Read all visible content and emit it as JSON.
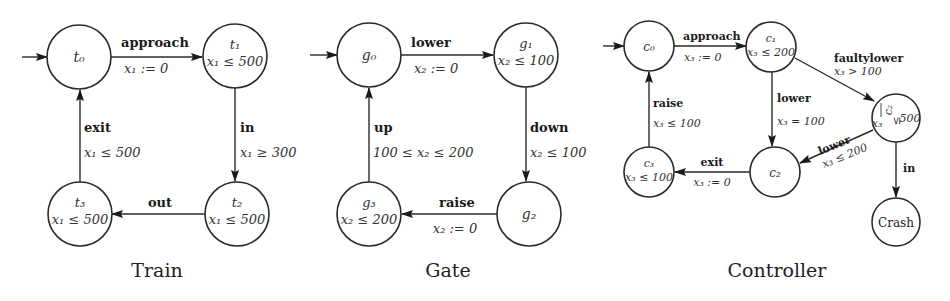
{
  "automata": [
    {
      "name": "Train",
      "caption": "Train",
      "states": [
        {
          "id": "t0",
          "name": "t0",
          "invariant": "",
          "initial": true
        },
        {
          "id": "t1",
          "name": "t1",
          "invariant": "x1 ≤ 500"
        },
        {
          "id": "t2",
          "name": "t2",
          "invariant": "x1 ≤ 500"
        },
        {
          "id": "t3",
          "name": "t3",
          "invariant": "x1 ≤ 500"
        }
      ],
      "transitions": [
        {
          "from": "t0",
          "to": "t1",
          "action": "approach",
          "guard_or_reset": "x1 := 0"
        },
        {
          "from": "t1",
          "to": "t2",
          "action": "in",
          "guard_or_reset": "x1 ≥ 300"
        },
        {
          "from": "t2",
          "to": "t3",
          "action": "out",
          "guard_or_reset": ""
        },
        {
          "from": "t3",
          "to": "t0",
          "action": "exit",
          "guard_or_reset": "x1 ≤ 500"
        }
      ]
    },
    {
      "name": "Gate",
      "caption": "Gate",
      "states": [
        {
          "id": "g0",
          "name": "g0",
          "invariant": "",
          "initial": true
        },
        {
          "id": "g1",
          "name": "g1",
          "invariant": "x2 ≤ 100"
        },
        {
          "id": "g2",
          "name": "g2",
          "invariant": ""
        },
        {
          "id": "g3",
          "name": "g3",
          "invariant": "x2 ≤ 200"
        }
      ],
      "transitions": [
        {
          "from": "g0",
          "to": "g1",
          "action": "lower",
          "guard_or_reset": "x2 := 0"
        },
        {
          "from": "g1",
          "to": "g2",
          "action": "down",
          "guard_or_reset": "x2 ≤ 100"
        },
        {
          "from": "g2",
          "to": "g3",
          "action": "raise",
          "guard_or_reset": "x2 := 0"
        },
        {
          "from": "g3",
          "to": "g0",
          "action": "up",
          "guard_or_reset": "100 ≤ x2 ≤ 200"
        }
      ]
    },
    {
      "name": "Controller",
      "caption": "Controller",
      "states": [
        {
          "id": "c0",
          "name": "c0",
          "invariant": "",
          "initial": true
        },
        {
          "id": "c1",
          "name": "c1",
          "invariant": "x3 ≤ 200"
        },
        {
          "id": "c2",
          "name": "c2",
          "invariant": ""
        },
        {
          "id": "c2bar",
          "name": "c̅2",
          "invariant": "x3 ≤ 500"
        },
        {
          "id": "c3",
          "name": "c3",
          "invariant": "x3 ≤ 100"
        },
        {
          "id": "crash",
          "name": "Crash",
          "invariant": ""
        }
      ],
      "transitions": [
        {
          "from": "c0",
          "to": "c1",
          "action": "approach",
          "guard_or_reset": "x3 := 0"
        },
        {
          "from": "c1",
          "to": "c2",
          "action": "lower",
          "guard_or_reset": "x3 = 100"
        },
        {
          "from": "c1",
          "to": "c2bar",
          "action": "faultylower",
          "guard_or_reset": "x3 > 100"
        },
        {
          "from": "c2bar",
          "to": "c2",
          "action": "lower",
          "guard_or_reset": "x3 ≤ 200"
        },
        {
          "from": "c2bar",
          "to": "crash",
          "action": "in",
          "guard_or_reset": ""
        },
        {
          "from": "c2",
          "to": "c3",
          "action": "exit",
          "guard_or_reset": "x3 := 0"
        },
        {
          "from": "c3",
          "to": "c0",
          "action": "raise",
          "guard_or_reset": "x3 ≤ 100"
        }
      ]
    }
  ],
  "labels": {
    "train": {
      "t0": "t₀",
      "t1": "t₁",
      "t2": "t₂",
      "t3": "t₃",
      "inv_t1": "x₁ ≤ 500",
      "inv_t2": "x₁ ≤ 500",
      "inv_t3": "x₁ ≤ 500",
      "approach": "approach",
      "approach_reset": "x₁ := 0",
      "in": "in",
      "in_guard": "x₁ ≥ 300",
      "out": "out",
      "exit": "exit",
      "exit_guard": "x₁ ≤ 500",
      "caption": "Train"
    },
    "gate": {
      "g0": "g₀",
      "g1": "g₁",
      "g2": "g₂",
      "g3": "g₃",
      "inv_g1": "x₂ ≤ 100",
      "inv_g3": "x₂ ≤ 200",
      "lower": "lower",
      "lower_reset": "x₂ := 0",
      "down": "down",
      "down_guard": "x₂ ≤ 100",
      "raise": "raise",
      "raise_reset": "x₂ := 0",
      "up": "up",
      "up_guard": "100 ≤ x₂ ≤ 200",
      "caption": "Gate"
    },
    "controller": {
      "c0": "c₀",
      "c1": "c₁",
      "c2": "c₂",
      "c2bar": "c₂",
      "c3": "c₃",
      "crash": "Crash",
      "inv_c1": "x₃ ≤ 200",
      "inv_c2bar": "x₃ ≤ 500",
      "inv_c3": "x₃ ≤ 100",
      "approach": "approach",
      "approach_reset": "x₃ := 0",
      "lower1": "lower",
      "lower1_guard": "x₃ = 100",
      "faultylower": "faultylower",
      "faultylower_guard": "x₃ > 100",
      "lower2": "lower",
      "lower2_guard": "x₃ ≤ 200",
      "in": "in",
      "exit": "exit",
      "exit_reset": "x₃ := 0",
      "raise": "raise",
      "raise_guard": "x₃ ≤ 100",
      "caption": "Controller"
    }
  }
}
